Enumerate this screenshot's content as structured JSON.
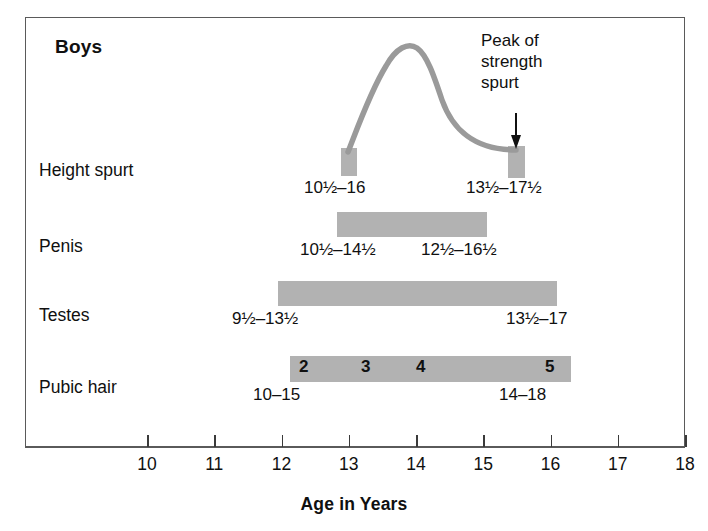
{
  "title": "Boys",
  "axis": {
    "title": "Age in Years",
    "ticks": [
      {
        "value": 10,
        "label": "10"
      },
      {
        "value": 11,
        "label": "11"
      },
      {
        "value": 12,
        "label": "12"
      },
      {
        "value": 13,
        "label": "13"
      },
      {
        "value": 14,
        "label": "14"
      },
      {
        "value": 15,
        "label": "15"
      },
      {
        "value": 16,
        "label": "16"
      },
      {
        "value": 17,
        "label": "17"
      },
      {
        "value": 18,
        "label": "18"
      }
    ]
  },
  "rows": [
    {
      "label": "Height spurt"
    },
    {
      "label": "Penis"
    },
    {
      "label": "Testes"
    },
    {
      "label": "Pubic hair"
    }
  ],
  "ranges": {
    "height_left": "10½–16",
    "height_right": "13½–17½",
    "penis_left": "10½–14½",
    "penis_right": "12½–16½",
    "testes_left": "9½–13½",
    "testes_right": "13½–17",
    "pubic_left": "10–15",
    "pubic_right": "14–18"
  },
  "stages": [
    {
      "label": "2"
    },
    {
      "label": "3"
    },
    {
      "label": "4"
    },
    {
      "label": "5"
    }
  ],
  "callout": {
    "line1": "Peak of",
    "line2": "strength",
    "line3": "spurt"
  },
  "colors": {
    "bar_fill": "#b2b2b2",
    "curve": "#9a9a9a",
    "frame": "#5a5a5a",
    "text": "#101010"
  },
  "chart_data": {
    "type": "bar",
    "title": "Boys",
    "xlabel": "Age in Years",
    "ylabel": "",
    "xlim": [
      9.7,
      18.0
    ],
    "grid": false,
    "legend": "none",
    "orientation": "horizontal-ranges",
    "categories": [
      "Height spurt",
      "Penis",
      "Testes",
      "Pubic hair"
    ],
    "series": [
      {
        "name": "Height spurt",
        "markers": [
          {
            "kind": "onset-box",
            "center_age": 12.85,
            "range_label": "10½–16",
            "range_start": 10.5,
            "range_end": 16
          },
          {
            "kind": "completion-box",
            "center_age": 15.35,
            "range_label": "13½–17½",
            "range_start": 13.5,
            "range_end": 17.5
          }
        ],
        "curve": {
          "label": "height velocity curve",
          "peak_age": 14.0,
          "start_age": 12.85,
          "end_age": 15.35
        }
      },
      {
        "name": "Penis",
        "bar_start_age": 12.8,
        "bar_end_age": 15.0,
        "onset_range_label": "10½–14½",
        "onset_range": [
          10.5,
          14.5
        ],
        "completion_range_label": "12½–16½",
        "completion_range": [
          12.5,
          16.5
        ]
      },
      {
        "name": "Testes",
        "bar_start_age": 11.9,
        "bar_end_age": 16.0,
        "onset_range_label": "9½–13½",
        "onset_range": [
          9.5,
          13.5
        ],
        "completion_range_label": "13½–17",
        "completion_range": [
          13.5,
          17
        ]
      },
      {
        "name": "Pubic hair",
        "bar_start_age": 12.1,
        "bar_end_age": 16.25,
        "onset_range_label": "10–15",
        "onset_range": [
          10,
          15
        ],
        "completion_range_label": "14–18",
        "completion_range": [
          14,
          18
        ],
        "stage_labels": [
          "2",
          "3",
          "4",
          "5"
        ],
        "stage_ages": [
          12.25,
          13.15,
          13.95,
          15.85
        ]
      }
    ],
    "annotations": [
      {
        "text": "Peak of strength spurt",
        "pointer_age": 15.35,
        "arrow": "down"
      }
    ]
  }
}
